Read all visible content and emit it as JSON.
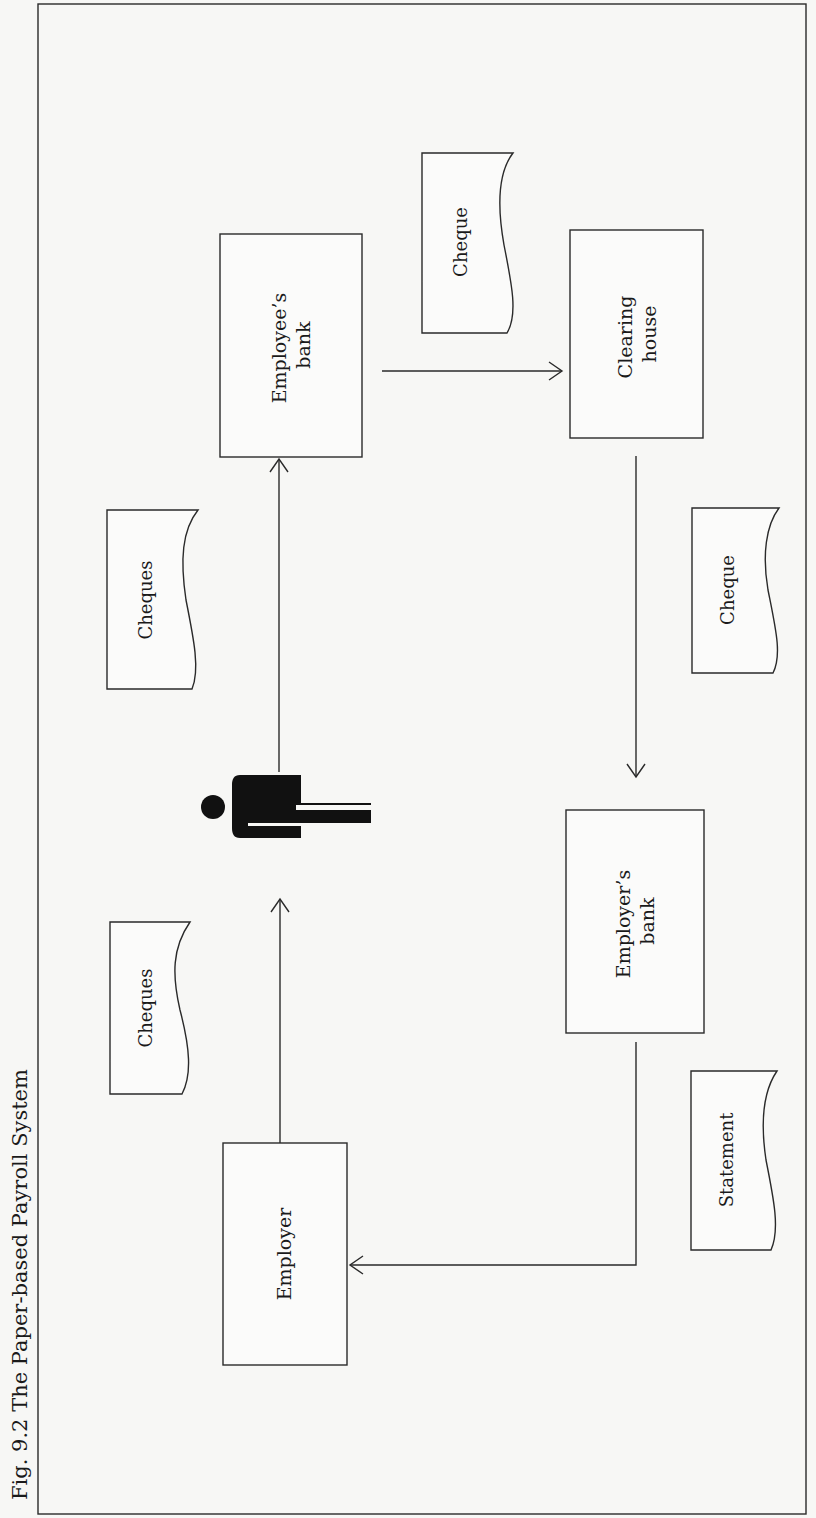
{
  "figure": {
    "caption": "Fig. 9.2  The Paper-based Payroll System",
    "orientation": "rotated-90-ccw"
  },
  "nodes": {
    "employer": {
      "label": "Employer",
      "shape": "process-box"
    },
    "employee": {
      "label": "",
      "shape": "person-icon"
    },
    "employees_bank": {
      "label_line1": "Employee’s",
      "label_line2": "bank",
      "shape": "process-box"
    },
    "clearing_house": {
      "label_line1": "Clearing",
      "label_line2": "house",
      "shape": "process-box"
    },
    "employers_bank": {
      "label_line1": "Employer’s",
      "label_line2": "bank",
      "shape": "process-box"
    }
  },
  "documents": {
    "cheques_1": {
      "label": "Cheques"
    },
    "cheques_2": {
      "label": "Cheques"
    },
    "cheque_top": {
      "label": "Cheque"
    },
    "cheque_right": {
      "label": "Cheque"
    },
    "statement": {
      "label": "Statement"
    }
  },
  "flows": [
    {
      "from": "Employer",
      "to": "Employee",
      "carries": "Cheques"
    },
    {
      "from": "Employee",
      "to": "Employee’s bank",
      "carries": "Cheques"
    },
    {
      "from": "Employee’s bank",
      "to": "Clearing house",
      "carries": "Cheque"
    },
    {
      "from": "Clearing house",
      "to": "Employer’s bank",
      "carries": "Cheque"
    },
    {
      "from": "Employer’s bank",
      "to": "Employer",
      "carries": "Statement"
    }
  ],
  "colors": {
    "ink": "#2a2a2a",
    "paper": "#f7f7f5"
  }
}
